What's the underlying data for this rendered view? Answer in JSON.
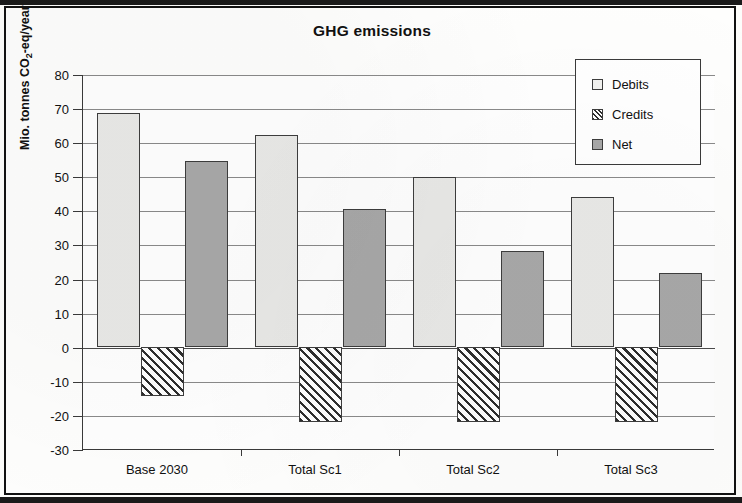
{
  "chart_data": {
    "type": "bar",
    "title": "GHG emissions",
    "xlabel": "",
    "ylabel": "Mio. tonnes CO2-eq/year",
    "ylabel_prefix": "Mio. tonnes CO",
    "ylabel_sub": "2",
    "ylabel_suffix": "-eq/year",
    "categories": [
      "Base 2030",
      "Total Sc1",
      "Total Sc2",
      "Total Sc3"
    ],
    "series": [
      {
        "name": "Debits",
        "values": [
          68.5,
          62.0,
          49.7,
          44.0
        ]
      },
      {
        "name": "Credits",
        "values": [
          -14.5,
          -22.0,
          -22.0,
          -22.0
        ]
      },
      {
        "name": "Net",
        "values": [
          54.5,
          40.5,
          28.0,
          21.5
        ]
      }
    ],
    "ylim": [
      -30,
      80
    ],
    "ytick_step": 10,
    "yticks": [
      80,
      70,
      60,
      50,
      40,
      30,
      20,
      10,
      0,
      -10,
      -20,
      -30
    ],
    "ytick_labels": [
      "80",
      "70",
      "60",
      "50",
      "40",
      "30",
      "20",
      "10",
      "0",
      "-10",
      "-20",
      "-30"
    ],
    "grid": true,
    "grid_axis": "y",
    "legend_position": "top-right",
    "colors": {
      "debits": "#e9e9e7",
      "credits": "#2e2e2e",
      "net": "#a8a8a8",
      "axis": "#3a3a3a",
      "grid": "#8a8a8a",
      "text": "#111111"
    }
  },
  "legend": {
    "items": [
      {
        "label": "Debits",
        "style": "debits"
      },
      {
        "label": "Credits",
        "style": "credits"
      },
      {
        "label": "Net",
        "style": "net"
      }
    ]
  }
}
